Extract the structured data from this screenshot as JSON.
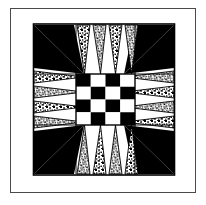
{
  "figure": {
    "title": "Quilt Block Pattern",
    "kind": "pieced-quilt-block-diagram",
    "caption": ""
  },
  "colors": {
    "background": "#ffffff",
    "ink": "#000000",
    "frame": "#4a4a4a",
    "patch_dark": "#000000",
    "patch_light": "#ffffff",
    "patch_print": "#000000"
  },
  "frame": {
    "label": "outer-frame",
    "style": "thin single rule",
    "inset_left": 10,
    "inset_top": 8,
    "width": 186,
    "height": 185
  },
  "block": {
    "label": "quilt-block",
    "grid": "3x3",
    "width": 144,
    "height": 155,
    "border": "thin black outline"
  },
  "corners": [
    {
      "name": "corner-top-left",
      "fabric": "solid-dark",
      "shape": "triangle-spike",
      "points_toward": "center"
    },
    {
      "name": "corner-top-right",
      "fabric": "solid-dark",
      "shape": "triangle-spike",
      "points_toward": "center"
    },
    {
      "name": "corner-bottom-left",
      "fabric": "solid-dark",
      "shape": "triangle-spike",
      "points_toward": "center"
    },
    {
      "name": "corner-bottom-right",
      "fabric": "solid-dark",
      "shape": "triangle-spike",
      "points_toward": "center"
    }
  ],
  "edges": [
    {
      "name": "edge-top",
      "fabric": "stippled-print",
      "spike_count": 4,
      "direction": "down"
    },
    {
      "name": "edge-left",
      "fabric": "stippled-print",
      "spike_count": 4,
      "direction": "right"
    },
    {
      "name": "edge-right",
      "fabric": "stippled-print",
      "spike_count": 4,
      "direction": "left"
    },
    {
      "name": "edge-bottom",
      "fabric": "stippled-print",
      "spike_count": 4,
      "direction": "up"
    }
  ],
  "center": {
    "name": "center-checkerboard",
    "rows": 4,
    "cols": 4,
    "pattern": [
      [
        1,
        0,
        1,
        0
      ],
      [
        0,
        1,
        0,
        1
      ],
      [
        1,
        0,
        1,
        0
      ],
      [
        0,
        1,
        0,
        1
      ]
    ],
    "legend": {
      "1": "dark",
      "0": "light"
    }
  }
}
